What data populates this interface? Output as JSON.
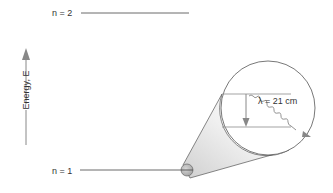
{
  "diagram": {
    "levels": [
      {
        "label": "n = 2"
      },
      {
        "label": "n = 1"
      }
    ],
    "axis": {
      "label": "Energy, E"
    },
    "transition": {
      "wavelength_label": "λ = 21 cm"
    },
    "colors": {
      "line": "#333333",
      "arrow": "#888888",
      "cone_light": "#f2f2f2",
      "cone_dark": "#b8b8b8"
    }
  }
}
